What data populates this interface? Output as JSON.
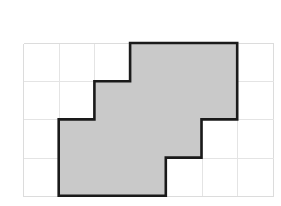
{
  "figure": {
    "title": "Shaded polygon on square grid",
    "background_color": "#ffffff",
    "grid": {
      "columns": 7,
      "rows": 4,
      "origin_x": 23,
      "origin_y": 43,
      "cell_width": 35.7,
      "cell_height": 38.2,
      "line_color": "#dcdcdc",
      "inner_line_color": "#e4e4e4",
      "line_width": 1
    },
    "polygon": {
      "name": "shaded-region",
      "fill_color": "#c9c9c9",
      "stroke_color": "#1a1a1a",
      "stroke_width": 2.6,
      "area_cells": 13,
      "vertices_grid": [
        [
          3,
          0
        ],
        [
          6,
          0
        ],
        [
          6,
          2
        ],
        [
          5,
          2
        ],
        [
          5,
          3
        ],
        [
          4,
          3
        ],
        [
          4,
          4
        ],
        [
          1,
          4
        ],
        [
          1,
          2
        ],
        [
          2,
          2
        ],
        [
          2,
          1
        ],
        [
          3,
          1
        ]
      ]
    }
  }
}
